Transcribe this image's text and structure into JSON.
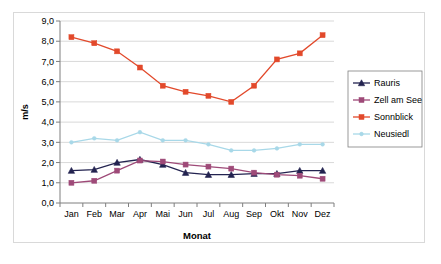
{
  "chart_data": {
    "type": "line",
    "title": "",
    "xlabel": "Monat",
    "ylabel": "m/s",
    "categories": [
      "Jan",
      "Feb",
      "Mar",
      "Apr",
      "Mai",
      "Jun",
      "Jul",
      "Aug",
      "Sep",
      "Okt",
      "Nov",
      "Dez"
    ],
    "ylim": [
      0.0,
      9.0
    ],
    "ytick_labels": [
      "0,0",
      "1,0",
      "2,0",
      "3,0",
      "4,0",
      "5,0",
      "6,0",
      "7,0",
      "8,0",
      "9,0"
    ],
    "ytick_values": [
      0,
      1,
      2,
      3,
      4,
      5,
      6,
      7,
      8,
      9
    ],
    "grid": true,
    "legend_position": "right",
    "series": [
      {
        "name": "Rauris",
        "color": "#232350",
        "marker": "triangle",
        "values": [
          1.6,
          1.65,
          2.0,
          2.15,
          1.9,
          1.5,
          1.4,
          1.4,
          1.45,
          1.45,
          1.6,
          1.6
        ]
      },
      {
        "name": "Zell am See",
        "color": "#9E4A78",
        "marker": "square",
        "values": [
          1.0,
          1.1,
          1.6,
          2.1,
          2.05,
          1.9,
          1.8,
          1.7,
          1.5,
          1.4,
          1.35,
          1.2
        ]
      },
      {
        "name": "Sonnblick",
        "color": "#E2492B",
        "marker": "square",
        "values": [
          8.2,
          7.9,
          7.5,
          6.7,
          5.8,
          5.5,
          5.3,
          5.0,
          5.8,
          7.1,
          7.4,
          8.3
        ]
      },
      {
        "name": "Neusiedl",
        "color": "#A8D8E8",
        "marker": "dot",
        "values": [
          3.0,
          3.2,
          3.1,
          3.5,
          3.1,
          3.1,
          2.9,
          2.6,
          2.6,
          2.7,
          2.9,
          2.9
        ]
      }
    ]
  },
  "legend": {
    "items": [
      {
        "label": "Rauris"
      },
      {
        "label": "Zell am See"
      },
      {
        "label": "Sonnblick"
      },
      {
        "label": "Neusiedl"
      }
    ]
  }
}
